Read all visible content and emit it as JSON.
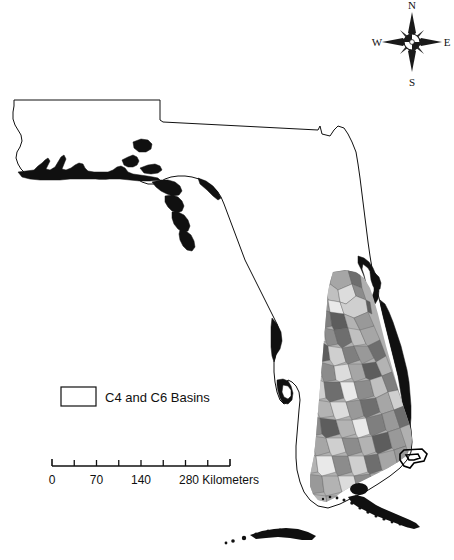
{
  "figure": {
    "background_color": "#ffffff",
    "outline_color": "#101010"
  },
  "compass": {
    "name": "compass-rose",
    "north": "N",
    "south": "S",
    "east": "E",
    "west": "W"
  },
  "legend": {
    "entries": [
      {
        "label": "C4 and C6 Basins",
        "swatch_fill": "#ffffff",
        "swatch_stroke": "#101010"
      }
    ]
  },
  "scalebar": {
    "units": "Kilometers",
    "min": 0,
    "max": 280,
    "segments": 8,
    "labels": [
      {
        "value": "0",
        "position": 0
      },
      {
        "value": "70",
        "position": 70
      },
      {
        "value": "140",
        "position": 140
      },
      {
        "value": "280",
        "position": 280
      }
    ],
    "unit_label": "280 Kilometers"
  },
  "basins": {
    "description": "South Florida Water Management District sub-basin polygons",
    "gray_shades": [
      "#e9e9e9",
      "#dcdcdc",
      "#cfcfcf",
      "#c0c0c0",
      "#b3b3b3",
      "#a6a6a6",
      "#999999",
      "#8c8c8c",
      "#7f7f7f",
      "#6e6e6e",
      "#5d5d5d"
    ],
    "highlight_stroke": "#000000"
  },
  "footer": {
    "text": ""
  }
}
